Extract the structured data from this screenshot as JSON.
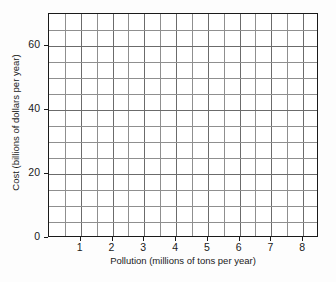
{
  "chart_data": {
    "type": "scatter",
    "title": "",
    "subtitle": "",
    "xlabel": "Pollution (millions of tons per year)",
    "ylabel": "Cost (billions of dollars per year)",
    "xlim": [
      0,
      8.5
    ],
    "ylim": [
      0,
      70
    ],
    "grid": true,
    "legend": null,
    "x_major_ticks": [
      1,
      2,
      3,
      4,
      5,
      6,
      7,
      8
    ],
    "x_major_tick_labels": [
      "1",
      "2",
      "3",
      "4",
      "5",
      "6",
      "7",
      "8"
    ],
    "x_minor_tick_step": 0.5,
    "y_major_ticks": [
      0,
      20,
      40,
      60
    ],
    "y_major_tick_labels": [
      "0",
      "20",
      "40",
      "60"
    ],
    "y_gridline_step": 5,
    "x_gridlines": [
      0.5,
      1,
      1.5,
      2,
      2.5,
      3,
      3.5,
      4,
      4.5,
      5,
      5.5,
      6,
      6.5,
      7,
      7.5,
      8
    ],
    "y_gridlines": [
      5,
      10,
      15,
      20,
      25,
      30,
      35,
      40,
      45,
      50,
      55,
      60,
      65
    ],
    "series": [],
    "x": [],
    "values": [],
    "annotations": [],
    "note": "Blank plotting grid with axes and gridlines; no data series plotted.",
    "colors": {
      "background": "#ffffff",
      "page_background": "#fdfdfd",
      "axis": "#1a1a1a",
      "gridline_major": "#6b6b6b",
      "gridline_minor": "#8f8f8f",
      "text": "#1a1a1a"
    }
  }
}
